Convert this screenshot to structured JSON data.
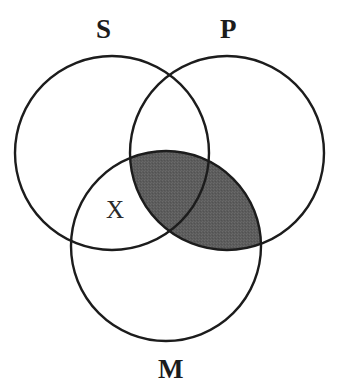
{
  "figure": {
    "type": "venn-diagram",
    "kind": "three-circle-syllogism",
    "background_color": "#ffffff",
    "stroke_color": "#1c1c1c",
    "shade_color": "#5c5c5c",
    "width": 338,
    "height": 389
  },
  "labels": {
    "s": "S",
    "p": "P",
    "m": "M",
    "x": "X"
  },
  "circles": [
    {
      "id": "S",
      "label": "S",
      "cx": 112,
      "cy": 153,
      "r": 97
    },
    {
      "id": "P",
      "label": "P",
      "cx": 227,
      "cy": 153,
      "r": 97
    },
    {
      "id": "M",
      "label": "M",
      "cx": 166,
      "cy": 246,
      "r": 95
    }
  ],
  "markers": [
    {
      "id": "x-marker",
      "text": "X",
      "x": 117,
      "y": 210,
      "region": "S-and-M-not-P"
    }
  ],
  "shaded_regions": [
    {
      "id": "p-and-m",
      "description": "intersection of P and M",
      "color": "#5c5c5c"
    }
  ]
}
